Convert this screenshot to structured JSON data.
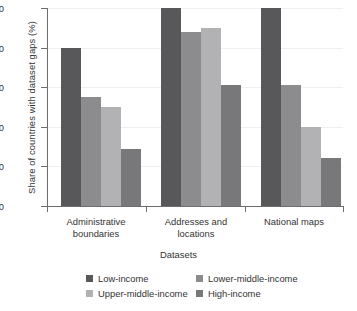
{
  "chart_data": {
    "type": "bar",
    "title": "",
    "xlabel": "Datasets",
    "ylabel": "Share of countries with dataset gaps (%)",
    "categories": [
      "Administrative boundaries",
      "Addresses and locations",
      "National maps"
    ],
    "series": [
      {
        "name": "Low-income",
        "color": "#58585a",
        "values": [
          80,
          100,
          100
        ]
      },
      {
        "name": "Lower-middle-income",
        "color": "#8c8c8e",
        "values": [
          55,
          88,
          61
        ]
      },
      {
        "name": "Upper-middle-income",
        "color": "#b2b2b4",
        "values": [
          50,
          90,
          40
        ]
      },
      {
        "name": "High-income",
        "color": "#78787b",
        "values": [
          29,
          61,
          24
        ]
      }
    ],
    "ylim": [
      0,
      100
    ],
    "yticks": [
      "0",
      "20",
      "40",
      "60",
      "80",
      "100"
    ],
    "grid": true,
    "legend_position": "bottom"
  },
  "axis": {
    "y_title": "Share of countries with dataset gaps (%)",
    "x_title": "Datasets",
    "tick_0": "0",
    "tick_20": "20",
    "tick_40": "40",
    "tick_60": "60",
    "tick_80": "80",
    "tick_100": "100"
  },
  "categories": {
    "cat0_line1": "Administrative",
    "cat0_line2": "boundaries",
    "cat1_line1": "Addresses and",
    "cat1_line2": "locations",
    "cat2_line1": "National maps",
    "cat2_line2": ""
  },
  "legend": {
    "item0": "Low-income",
    "item1": "Lower-middle-income",
    "item2": "Upper-middle-income",
    "item3": "High-income"
  }
}
